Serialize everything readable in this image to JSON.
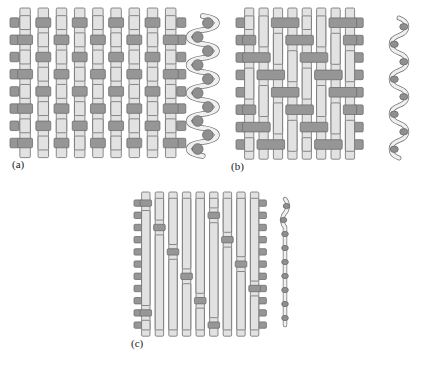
{
  "figure": {
    "background_color": "#ffffff",
    "warp_color": "#e2e2e2",
    "weft_color": "#969696",
    "outline_color": "#6f6f6f",
    "cross_section_ribbon_color": "#f0f0f0",
    "cross_section_yarn_color": "#8f8f8f"
  },
  "panels": [
    {
      "id": "a",
      "label": "(a)",
      "weave_name": "plain-weave",
      "description": "Plain weave: warp and weft interlace one over one",
      "columns": 9,
      "rows": 8,
      "float_length": 1,
      "cross_section": {
        "name": "plain-weave-cross-section",
        "amplitude": "high",
        "yarn_count": 10,
        "yarn_shape": "circle",
        "crimp": "maximum"
      }
    },
    {
      "id": "b",
      "label": "(b)",
      "weave_name": "twill-weave",
      "description": "Twill weave: two over two diagonal interlacing",
      "columns": 8,
      "rows": 8,
      "float_length": 2,
      "cross_section": {
        "name": "twill-weave-cross-section",
        "amplitude": "medium",
        "yarn_count": 8,
        "yarn_shape": "ellipse",
        "crimp": "moderate"
      }
    },
    {
      "id": "c",
      "label": "(c)",
      "weave_name": "satin-weave",
      "description": "Satin weave: long warp floats with scattered weft interlacings",
      "columns": 9,
      "rows": 11,
      "float_length": 4,
      "cross_section": {
        "name": "satin-weave-cross-section",
        "amplitude": "low",
        "yarn_count": 9,
        "yarn_shape": "flat-ellipse",
        "crimp": "minimal"
      }
    }
  ]
}
